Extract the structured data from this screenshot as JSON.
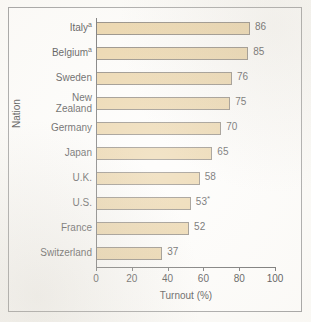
{
  "chart_data": {
    "type": "bar",
    "orientation": "horizontal",
    "title": "",
    "xlabel": "Turnout (%)",
    "ylabel": "Nation",
    "xlim": [
      0,
      100
    ],
    "xticks": [
      0,
      20,
      40,
      60,
      80,
      100
    ],
    "grid": false,
    "legend": null,
    "categories": [
      "Italy",
      "Belgium",
      "Sweden",
      "New Zealand",
      "Germany",
      "Japan",
      "U.K.",
      "U.S.",
      "France",
      "Switzerland"
    ],
    "values": [
      86,
      85,
      76,
      75,
      70,
      65,
      58,
      53,
      52,
      37
    ],
    "category_labels": [
      {
        "text": "Italy",
        "sup": "a",
        "lines": [
          "Italy"
        ]
      },
      {
        "text": "Belgium",
        "sup": "a",
        "lines": [
          "Belgium"
        ]
      },
      {
        "text": "Sweden",
        "sup": "",
        "lines": [
          "Sweden"
        ]
      },
      {
        "text": "New Zealand",
        "sup": "",
        "lines": [
          "New",
          "Zealand"
        ]
      },
      {
        "text": "Germany",
        "sup": "",
        "lines": [
          "Germany"
        ]
      },
      {
        "text": "Japan",
        "sup": "",
        "lines": [
          "Japan"
        ]
      },
      {
        "text": "U.K.",
        "sup": "",
        "lines": [
          "U.K."
        ]
      },
      {
        "text": "U.S.",
        "sup": "",
        "lines": [
          "U.S."
        ]
      },
      {
        "text": "France",
        "sup": "",
        "lines": [
          "France"
        ]
      },
      {
        "text": "Switzerland",
        "sup": "",
        "lines": [
          "Switzerland"
        ]
      }
    ],
    "value_labels": [
      "86",
      "85",
      "76",
      "75",
      "70",
      "65",
      "58",
      "53",
      "52",
      "37"
    ],
    "value_label_marks": [
      "",
      "",
      "",
      "",
      "",
      "",
      "",
      "*",
      "",
      ""
    ],
    "colors": {
      "bar_fill": "#e5c890",
      "bar_stroke": "#6d6458",
      "axis": "#4a4a4a",
      "frame": "#8d8d8d",
      "text": "#1a1a1a",
      "background": "#fdfcfa"
    }
  }
}
